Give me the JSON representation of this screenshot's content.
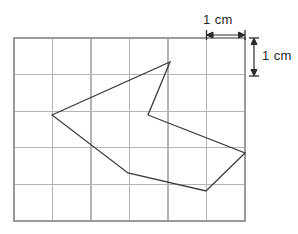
{
  "figure": {
    "background_color": "#ffffff",
    "grid": {
      "columns": 6,
      "rows": 5,
      "cell_size_px": 38.5,
      "origin_x_px": 14,
      "origin_y_px": 38,
      "line_color": "#b4b4b4",
      "border_color": "#9a9a9a",
      "line_width_px": 1.2,
      "border_width_px": 1.6
    },
    "shape": {
      "name": "arrow-polygon",
      "stroke_color": "#3c3c3c",
      "stroke_width_px": 1.3,
      "fill": "none",
      "closed": true,
      "vertices_px": [
        [
          52,
          115
        ],
        [
          170,
          62
        ],
        [
          148,
          115
        ],
        [
          245,
          153
        ],
        [
          206,
          191
        ],
        [
          128,
          173
        ]
      ],
      "vertices_cm": [
        [
          1.0,
          2.0
        ],
        [
          4.05,
          0.62
        ],
        [
          3.48,
          2.0
        ],
        [
          6.0,
          2.99
        ],
        [
          4.99,
          3.97
        ],
        [
          2.96,
          3.51
        ]
      ]
    },
    "annotations": {
      "horizontal_scale": {
        "label": "1 cm",
        "arrow_color": "#2b2b2b",
        "x_start_px": 207,
        "x_end_px": 245,
        "y_px": 35
      },
      "vertical_scale": {
        "label": "1 cm",
        "arrow_color": "#2b2b2b",
        "x_px": 254,
        "y_start_px": 38,
        "y_end_px": 76
      }
    }
  },
  "chart_data": {
    "type": "scatter",
    "xlabel": "x (cm)",
    "ylabel": "y (cm)",
    "xlim": [
      0,
      6
    ],
    "ylim": [
      0,
      5
    ],
    "grid": true,
    "legend": "none",
    "gridline_spacing_cm": 1,
    "categories": [
      "A",
      "B",
      "C",
      "D",
      "E",
      "F"
    ],
    "series": [
      {
        "name": "polygon-outline",
        "closed": true,
        "x": [
          1.0,
          4.05,
          3.48,
          6.0,
          4.99,
          2.96
        ],
        "y": [
          2.0,
          0.62,
          2.0,
          2.99,
          3.97,
          3.51
        ]
      }
    ],
    "annotations": [
      "1 cm",
      "1 cm"
    ]
  }
}
